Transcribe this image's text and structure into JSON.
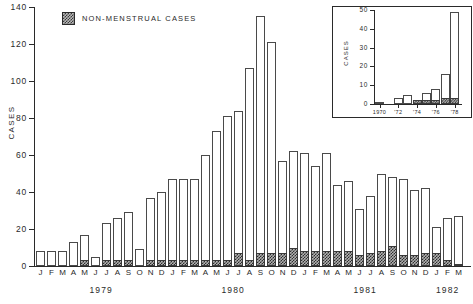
{
  "chart_data": [
    {
      "id": "main",
      "type": "bar",
      "title": "",
      "xlabel": "",
      "ylabel": "CASES",
      "ylim": [
        0,
        140
      ],
      "yticks": [
        0,
        20,
        40,
        60,
        80,
        100,
        120,
        140
      ],
      "grid": false,
      "stacked": true,
      "legend": [
        {
          "label": "NON-MENSTRUAL CASES",
          "swatch": "hatched",
          "color": "#b0b0b0"
        }
      ],
      "legend_position": "top-left",
      "categories": [
        "J",
        "F",
        "M",
        "A",
        "M",
        "J",
        "J",
        "A",
        "S",
        "O",
        "N",
        "D",
        "J",
        "F",
        "M",
        "A",
        "M",
        "J",
        "J",
        "A",
        "S",
        "O",
        "N",
        "D",
        "J",
        "F",
        "M",
        "A",
        "M",
        "J",
        "J",
        "A",
        "S",
        "O",
        "N",
        "D",
        "J",
        "F",
        "M"
      ],
      "year_groups": [
        {
          "label": "1979",
          "start_index": 0,
          "end_index": 11
        },
        {
          "label": "1980",
          "start_index": 12,
          "end_index": 23
        },
        {
          "label": "1981",
          "start_index": 24,
          "end_index": 35
        },
        {
          "label": "1982",
          "start_index": 36,
          "end_index": 38
        }
      ],
      "series": [
        {
          "name": "Total cases",
          "values": [
            8,
            8,
            8,
            13,
            17,
            5,
            23,
            26,
            29,
            9,
            37,
            40,
            47,
            47,
            47,
            60,
            73,
            81,
            84,
            107,
            135,
            121,
            57,
            62,
            61,
            54,
            61,
            44,
            46,
            31,
            38,
            50,
            48,
            47,
            41,
            42,
            21,
            26,
            27
          ]
        },
        {
          "name": "NON-MENSTRUAL CASES",
          "values": [
            0,
            0,
            0,
            0,
            3,
            0,
            3,
            3,
            3,
            0,
            3,
            3,
            3,
            3,
            3,
            3,
            3,
            3,
            7,
            3,
            7,
            7,
            7,
            10,
            8,
            8,
            8,
            8,
            8,
            6,
            7,
            8,
            11,
            6,
            6,
            7,
            7,
            3,
            1
          ]
        }
      ]
    },
    {
      "id": "inset",
      "type": "bar",
      "title": "",
      "xlabel": "",
      "ylabel": "CASES",
      "ylim": [
        0,
        50
      ],
      "yticks": [
        0,
        10,
        20,
        30,
        40,
        50
      ],
      "grid": false,
      "stacked": true,
      "categories": [
        "1970",
        "'71",
        "'72",
        "'73",
        "'74",
        "'75",
        "'76",
        "'77",
        "'78"
      ],
      "xtick_labels": [
        {
          "label": "1970",
          "index": 0
        },
        {
          "label": "'72",
          "index": 2
        },
        {
          "label": "'74",
          "index": 4
        },
        {
          "label": "'76",
          "index": 6
        },
        {
          "label": "'78",
          "index": 8
        }
      ],
      "series": [
        {
          "name": "Total cases",
          "values": [
            1,
            0,
            3,
            5,
            2,
            6,
            8,
            16,
            49
          ]
        },
        {
          "name": "NON-MENSTRUAL CASES",
          "values": [
            0,
            0,
            0,
            0,
            2,
            2,
            2,
            3,
            3
          ]
        }
      ]
    }
  ],
  "main": {
    "y_axis_title": "CASES",
    "legend_label": "NON-MENSTRUAL CASES"
  },
  "inset": {
    "y_axis_title": "CASES"
  }
}
